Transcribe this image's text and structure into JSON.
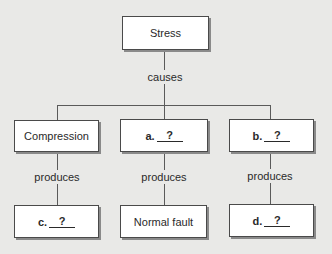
{
  "diagram": {
    "root": {
      "label": "Stress"
    },
    "root_relation": "causes",
    "branches": [
      {
        "mid": {
          "label": "Compression",
          "blank": false
        },
        "relation": "produces",
        "leaf": {
          "prefix": "c.",
          "answer": "?",
          "blank": true
        }
      },
      {
        "mid": {
          "prefix": "a.",
          "answer": "?",
          "blank": true
        },
        "relation": "produces",
        "leaf": {
          "label": "Normal fault",
          "blank": false
        }
      },
      {
        "mid": {
          "prefix": "b.",
          "answer": "?",
          "blank": true
        },
        "relation": "produces",
        "leaf": {
          "prefix": "d.",
          "answer": "?",
          "blank": true
        }
      }
    ]
  },
  "colors": {
    "background": "#e9e9e7",
    "box_fill": "#ffffff",
    "box_border": "#4a4a4a",
    "box_shadow": "#8a8a8a",
    "connector": "#5a5a5a"
  }
}
